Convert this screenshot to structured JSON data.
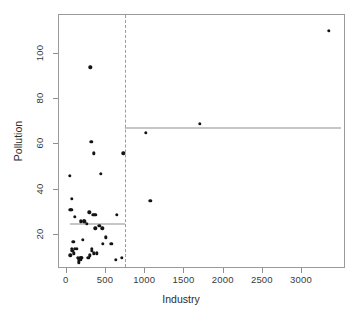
{
  "chart_data": {
    "type": "scatter",
    "title": "",
    "xlabel": "Industry",
    "ylabel": "Pollution",
    "xlim": [
      -100,
      3560
    ],
    "ylim": [
      5,
      117
    ],
    "xticks": [
      0,
      500,
      1000,
      1500,
      2000,
      2500,
      3000
    ],
    "xticklabels": [
      "0",
      "500",
      "1000",
      "1500",
      "2000",
      "2500",
      "3000"
    ],
    "yticks": [
      20,
      40,
      60,
      80,
      100
    ],
    "yticklabels": [
      "20",
      "40",
      "60",
      "80",
      "100"
    ],
    "grid": false,
    "legend": null,
    "marker": "filled-circle",
    "marker_color": "#141414",
    "points": [
      {
        "x": 35,
        "y": 46
      },
      {
        "x": 44,
        "y": 11
      },
      {
        "x": 46,
        "y": 31
      },
      {
        "x": 56,
        "y": 31
      },
      {
        "x": 61,
        "y": 36
      },
      {
        "x": 65,
        "y": 14
      },
      {
        "x": 72,
        "y": 13
      },
      {
        "x": 80,
        "y": 17
      },
      {
        "x": 91,
        "y": 12
      },
      {
        "x": 100,
        "y": 14
      },
      {
        "x": 104,
        "y": 28
      },
      {
        "x": 125,
        "y": 14
      },
      {
        "x": 136,
        "y": 10
      },
      {
        "x": 150,
        "y": 9
      },
      {
        "x": 156,
        "y": 8
      },
      {
        "x": 170,
        "y": 10
      },
      {
        "x": 180,
        "y": 26
      },
      {
        "x": 181,
        "y": 9
      },
      {
        "x": 186,
        "y": 10
      },
      {
        "x": 193,
        "y": 10
      },
      {
        "x": 204,
        "y": 18
      },
      {
        "x": 213,
        "y": 26
      },
      {
        "x": 225,
        "y": 26
      },
      {
        "x": 254,
        "y": 25
      },
      {
        "x": 275,
        "y": 10
      },
      {
        "x": 287,
        "y": 30
      },
      {
        "x": 295,
        "y": 11
      },
      {
        "x": 300,
        "y": 94
      },
      {
        "x": 311,
        "y": 61
      },
      {
        "x": 316,
        "y": 13
      },
      {
        "x": 320,
        "y": 14
      },
      {
        "x": 337,
        "y": 29
      },
      {
        "x": 343,
        "y": 56
      },
      {
        "x": 347,
        "y": 12
      },
      {
        "x": 354,
        "y": 29
      },
      {
        "x": 361,
        "y": 23
      },
      {
        "x": 368,
        "y": 29
      },
      {
        "x": 379,
        "y": 12
      },
      {
        "x": 412,
        "y": 24
      },
      {
        "x": 434,
        "y": 47
      },
      {
        "x": 453,
        "y": 23
      },
      {
        "x": 462,
        "y": 16
      },
      {
        "x": 497,
        "y": 19
      },
      {
        "x": 569,
        "y": 16
      },
      {
        "x": 625,
        "y": 9
      },
      {
        "x": 641,
        "y": 29
      },
      {
        "x": 699,
        "y": 10
      },
      {
        "x": 721,
        "y": 56
      },
      {
        "x": 1007,
        "y": 65
      },
      {
        "x": 1064,
        "y": 35
      },
      {
        "x": 1692,
        "y": 69
      },
      {
        "x": 3344,
        "y": 110
      }
    ],
    "split": {
      "name": "industry-split",
      "x": 748,
      "style": "dashed",
      "color": "#9b9b9b"
    },
    "mean_lines": [
      {
        "name": "left-group-mean",
        "x_start": 35,
        "x_end": 748,
        "y": 24.8,
        "color": "#8d8d8d"
      },
      {
        "name": "right-group-mean",
        "x_start": 748,
        "x_end": 3500,
        "y": 67.2,
        "color": "#8d8d8d"
      }
    ]
  },
  "axes": {
    "x_title": "Industry",
    "y_title": "Pollution"
  }
}
